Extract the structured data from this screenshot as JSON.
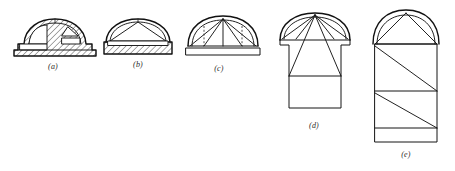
{
  "figure": {
    "background_color": "#ffffff",
    "line_color": "#111111",
    "width": 455,
    "height": 171,
    "panels": [
      {
        "id": "a",
        "caption": "(a)",
        "description": "Half-sectioned shallow dome on plinth with hatched masonry and stepped internal chambers",
        "has_hatching": true,
        "has_dashed_lines": false,
        "caption_x": 52,
        "caption_y": 64
      },
      {
        "id": "b",
        "caption": "(b)",
        "description": "Shallow dome with polygonal chord framing over hatched plinth slab",
        "has_hatching": true,
        "has_dashed_lines": false,
        "caption_x": 137,
        "caption_y": 62
      },
      {
        "id": "c",
        "caption": "(c)",
        "description": "Semicircular dome with radiating rib lines, dashed verticals and open plinth band",
        "has_hatching": false,
        "has_dashed_lines": true,
        "caption_x": 218,
        "caption_y": 66
      },
      {
        "id": "d",
        "caption": "(d)",
        "description": "Dome with radiating ribs set on a rectangular tower with triangulated bracing",
        "has_hatching": false,
        "has_dashed_lines": false,
        "caption_x": 313,
        "caption_y": 123
      },
      {
        "id": "e",
        "caption": "(e)",
        "description": "Tall tower with semicircular dome cap and three diagonally braced storeys",
        "has_hatching": false,
        "has_dashed_lines": false,
        "caption_x": 405,
        "caption_y": 152
      }
    ]
  }
}
